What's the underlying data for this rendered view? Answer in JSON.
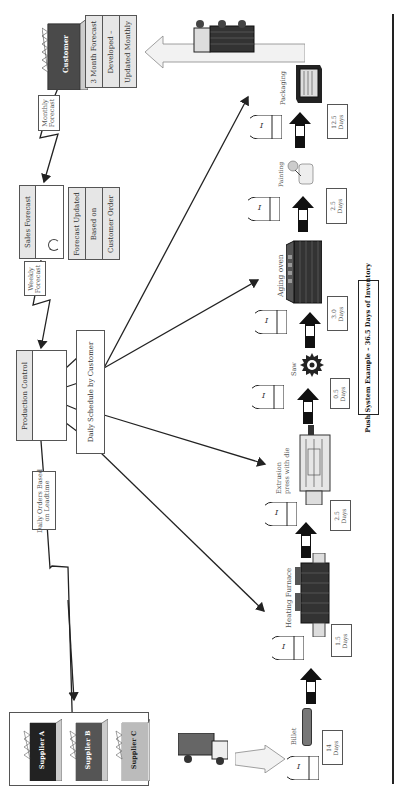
{
  "title": "Push System Example – 36.5 Days of Inventory",
  "customer": {
    "label": "Customer",
    "info": [
      "3 Month Forecast",
      "Developed –",
      "Updated Monthly"
    ]
  },
  "sales_forecast": {
    "label": "Sales Forecast",
    "info": [
      "Forecast Updated",
      "Based on",
      "Customer Order"
    ]
  },
  "production_control": {
    "label": "Production Control",
    "schedule": "Daily Schedule by Customer"
  },
  "flows": {
    "monthly_forecast": [
      "Monthly",
      "Forecast"
    ],
    "weekly_forecast": [
      "Weekly",
      "Forecast"
    ],
    "daily_orders": [
      "Daily Orders Based",
      "on Leadtime"
    ]
  },
  "suppliers": [
    "Supplier A",
    "Supplier B",
    "Supplier C"
  ],
  "process": {
    "billet": "Billet",
    "steps": [
      {
        "name": "Heating Furnace",
        "inventory": "1.5",
        "unit": "Days"
      },
      {
        "name": "Extrusion press with die",
        "line1": "Extrusion",
        "line2": "press with die",
        "inventory": "2.5",
        "unit": "Days"
      },
      {
        "name": "Saw",
        "inventory": "0.5",
        "unit": "Days"
      },
      {
        "name": "Aging oven",
        "inventory": "3.0",
        "unit": "Days"
      },
      {
        "name": "Painting",
        "inventory": "2.5",
        "unit": "Days"
      },
      {
        "name": "Packaging",
        "inventory": "12.5",
        "unit": "Days"
      }
    ],
    "raw_inventory": {
      "value": "14",
      "unit": "Days"
    },
    "inventory_symbol": "I"
  },
  "colors": {
    "supplier_a": "#222222",
    "supplier_b": "#555555",
    "supplier_c": "#bbbbbb",
    "customer": "#4a4a4a",
    "roof": "#cccccc",
    "shaded_header": "#e6e6e6"
  }
}
